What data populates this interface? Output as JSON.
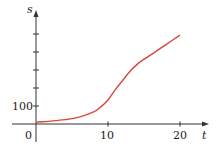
{
  "chart_data": {
    "type": "line",
    "title": "",
    "xlabel": "t",
    "ylabel": "s",
    "xlim": [
      0,
      23
    ],
    "ylim": [
      -20,
      560
    ],
    "x_ticks": [
      10,
      20
    ],
    "x_tick_labels": [
      "10",
      "20"
    ],
    "y_ticks": [
      100,
      200,
      300,
      400,
      500
    ],
    "y_tick_labels": [
      "100",
      "",
      "",
      "",
      ""
    ],
    "origin_label": "0",
    "grid": false,
    "legend": null,
    "series": [
      {
        "name": "s(t)",
        "color": "#d9473a",
        "x": [
          0,
          2,
          4,
          6,
          8,
          9,
          10,
          11,
          12,
          13,
          14,
          15,
          16,
          18,
          20
        ],
        "y": [
          10,
          16,
          24,
          38,
          67,
          95,
          133,
          190,
          240,
          290,
          330,
          360,
          385,
          440,
          494
        ]
      }
    ]
  }
}
